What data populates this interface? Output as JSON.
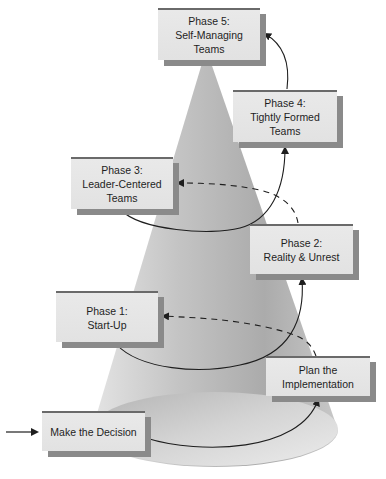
{
  "diagram": {
    "type": "cone-spiral-process",
    "colors": {
      "cone_light": "#d6d6d6",
      "cone_dark": "#a4a4a4",
      "box_fill": "#e6e6e6",
      "box_shadow": "#8a8a8a",
      "box_top_border": "#6a6a6a",
      "line": "#1e1e1e"
    },
    "entry_arrow": {
      "label": ""
    },
    "stages": [
      {
        "id": "make-decision",
        "lines": [
          "Make the Decision"
        ]
      },
      {
        "id": "plan-implementation",
        "lines": [
          "Plan the",
          "Implementation"
        ]
      },
      {
        "id": "phase-1",
        "lines": [
          "Phase 1:",
          "Start-Up"
        ]
      },
      {
        "id": "phase-2",
        "lines": [
          "Phase 2:",
          "Reality & Unrest"
        ]
      },
      {
        "id": "phase-3",
        "lines": [
          "Phase 3:",
          "Leader-Centered",
          "Teams"
        ]
      },
      {
        "id": "phase-4",
        "lines": [
          "Phase 4:",
          "Tightly Formed",
          "Teams"
        ]
      },
      {
        "id": "phase-5",
        "lines": [
          "Phase 5:",
          "Self-Managing",
          "Teams"
        ]
      }
    ],
    "connectors": [
      {
        "from": "make-decision",
        "to": "plan-implementation",
        "style": "solid"
      },
      {
        "from": "plan-implementation",
        "to": "phase-1",
        "style": "dashed"
      },
      {
        "from": "phase-1",
        "to": "phase-2",
        "style": "solid"
      },
      {
        "from": "phase-2",
        "to": "phase-3",
        "style": "dashed"
      },
      {
        "from": "phase-3",
        "to": "phase-4",
        "style": "solid"
      },
      {
        "from": "phase-4",
        "to": "phase-5",
        "style": "solid"
      }
    ]
  }
}
